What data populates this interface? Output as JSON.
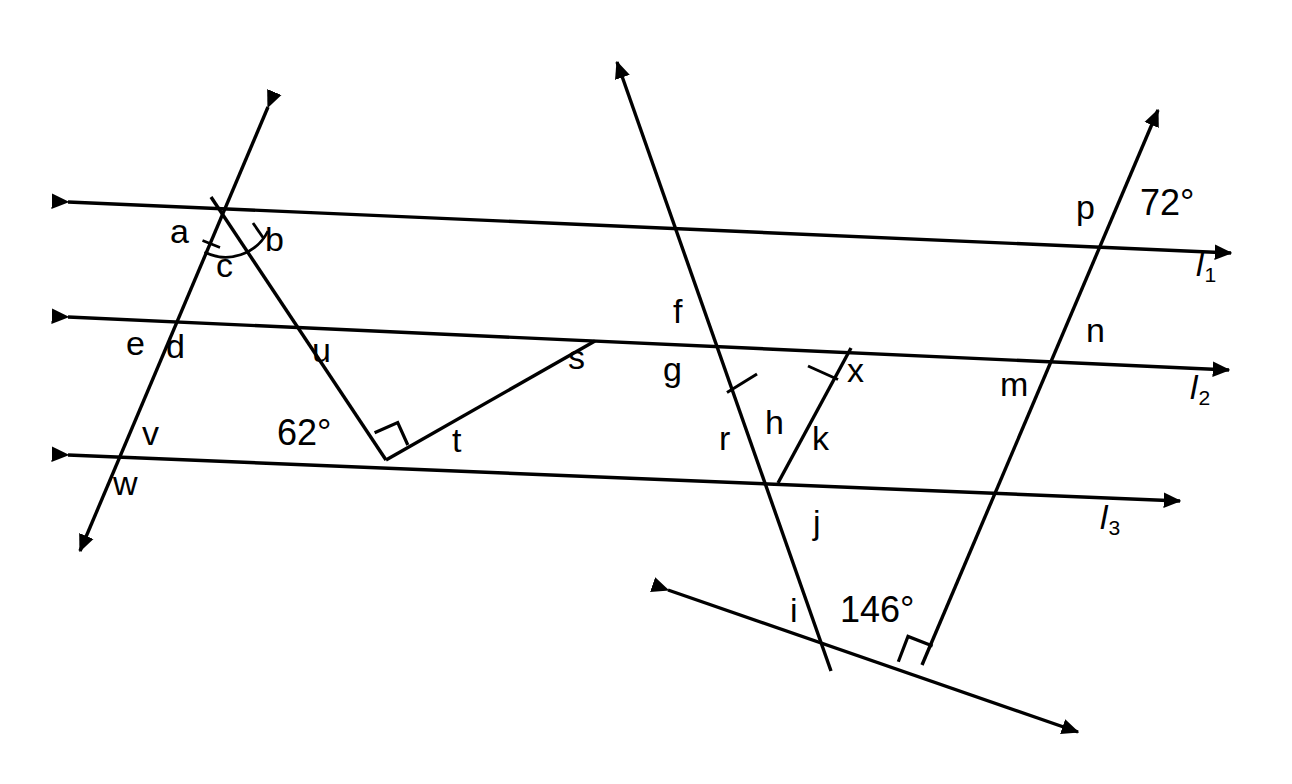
{
  "figure": {
    "background_color": "#ffffff",
    "stroke_color": "#000000",
    "width": 1292,
    "height": 784
  },
  "line_labels": [
    {
      "name": "line-label-l1",
      "base": "l",
      "sub": "1",
      "x": 1196,
      "y": 247
    },
    {
      "name": "line-label-l2",
      "base": "l",
      "sub": "2",
      "x": 1190,
      "y": 370
    },
    {
      "name": "line-label-l3",
      "base": "l",
      "sub": "3",
      "x": 1100,
      "y": 500
    }
  ],
  "point_labels": [
    {
      "name": "label-a",
      "text": "a",
      "x": 170,
      "y": 214
    },
    {
      "name": "label-b",
      "text": "b",
      "x": 265,
      "y": 222
    },
    {
      "name": "label-c",
      "text": "c",
      "x": 216,
      "y": 248
    },
    {
      "name": "label-e",
      "text": "e",
      "x": 126,
      "y": 326
    },
    {
      "name": "label-d",
      "text": "d",
      "x": 166,
      "y": 329
    },
    {
      "name": "label-u",
      "text": "u",
      "x": 312,
      "y": 333
    },
    {
      "name": "label-v",
      "text": "v",
      "x": 142,
      "y": 416
    },
    {
      "name": "label-w",
      "text": "w",
      "x": 113,
      "y": 466
    },
    {
      "name": "label-s",
      "text": "s",
      "x": 568,
      "y": 340
    },
    {
      "name": "label-t",
      "text": "t",
      "x": 452,
      "y": 423
    },
    {
      "name": "label-f",
      "text": "f",
      "x": 673,
      "y": 294
    },
    {
      "name": "label-g",
      "text": "g",
      "x": 663,
      "y": 352
    },
    {
      "name": "label-r",
      "text": "r",
      "x": 719,
      "y": 421
    },
    {
      "name": "label-h",
      "text": "h",
      "x": 765,
      "y": 405
    },
    {
      "name": "label-k",
      "text": "k",
      "x": 812,
      "y": 421
    },
    {
      "name": "label-x",
      "text": "x",
      "x": 847,
      "y": 353
    },
    {
      "name": "label-j",
      "text": "j",
      "x": 813,
      "y": 505
    },
    {
      "name": "label-i",
      "text": "i",
      "x": 790,
      "y": 593
    },
    {
      "name": "label-m",
      "text": "m",
      "x": 1000,
      "y": 367
    },
    {
      "name": "label-n",
      "text": "n",
      "x": 1086,
      "y": 313
    },
    {
      "name": "label-p",
      "text": "p",
      "x": 1076,
      "y": 190
    }
  ],
  "angle_labels": [
    {
      "name": "angle-label-72",
      "text": "72°",
      "x": 1140,
      "y": 185
    },
    {
      "name": "angle-label-62",
      "text": "62°",
      "x": 277,
      "y": 415
    },
    {
      "name": "angle-label-146",
      "text": "146°",
      "x": 840,
      "y": 592
    }
  ],
  "parallel_lines": [
    {
      "name": "line-l1",
      "x1": 68,
      "y1": 202,
      "x2": 1231,
      "y2": 253
    },
    {
      "name": "line-l2",
      "x1": 68,
      "y1": 317,
      "x2": 1229,
      "y2": 370
    },
    {
      "name": "line-l3",
      "x1": 68,
      "y1": 455,
      "x2": 1180,
      "y2": 501
    }
  ],
  "transversals": [
    {
      "name": "transversal-left-steep",
      "x1": 268,
      "y1": 107,
      "x2": 80,
      "y2": 551
    },
    {
      "name": "transversal-left-down-right",
      "x1": 211,
      "y1": 197,
      "x2": 386,
      "y2": 460
    },
    {
      "name": "transversal-middle",
      "x1": 617,
      "y1": 62,
      "x2": 831,
      "y2": 671
    },
    {
      "name": "transversal-right",
      "x1": 1158,
      "y1": 110,
      "x2": 922,
      "y2": 665
    },
    {
      "name": "segment-s-t",
      "x1": 595,
      "y1": 341,
      "x2": 386,
      "y2": 460
    },
    {
      "name": "segment-x-k",
      "x1": 851,
      "y1": 348,
      "x2": 778,
      "y2": 483
    },
    {
      "name": "line-diagonal-bottom",
      "x1": 668,
      "y1": 590,
      "x2": 1078,
      "y2": 732
    }
  ],
  "markings": [
    {
      "name": "right-angle-marker-62",
      "x": 386,
      "y": 460
    },
    {
      "name": "right-angle-marker-146",
      "x": 922,
      "y": 665
    },
    {
      "name": "angle-arc-c",
      "x": 225,
      "y": 210
    },
    {
      "name": "tick-mark-segment-r",
      "x": 742,
      "y": 383
    },
    {
      "name": "tick-mark-segment-x",
      "x": 823,
      "y": 372
    }
  ]
}
